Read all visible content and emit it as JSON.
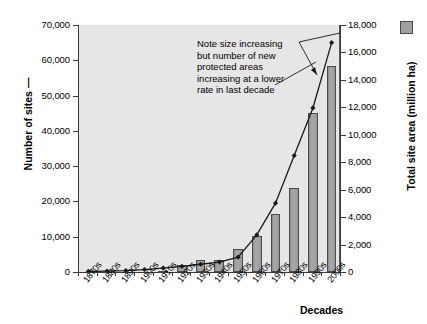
{
  "chart_data": {
    "type": "bar",
    "title": "",
    "xlabel": "Decades",
    "categories": [
      "1870s",
      "1880s",
      "1890s",
      "1900s",
      "1910s",
      "1920s",
      "1930s",
      "1940s",
      "1950s",
      "1960s",
      "1970s",
      "1980s",
      "1990s",
      "2000s"
    ],
    "grid": false,
    "legend_position": "top-right",
    "annotations": [
      {
        "text": "Note size increasing but number of new protected areas increasing at a lower rate in last decade",
        "lines": [
          "Note size increasing",
          "but number of new",
          "protected areas",
          "increasing at a lower",
          "rate in last decade"
        ]
      }
    ],
    "series": [
      {
        "name": "Total site area (million ha)",
        "type": "bar",
        "axis": "right",
        "ylabel": "Total site area (million ha)",
        "ylim": [
          0,
          18000
        ],
        "yticks": [
          "0",
          "2,000",
          "4,000",
          "6,000",
          "8,000",
          "10,000",
          "12,000",
          "14,000",
          "16,000",
          "18,000"
        ],
        "color": "#9e9e9e",
        "values": [
          0,
          0,
          0,
          0,
          100,
          500,
          900,
          900,
          1700,
          2600,
          4200,
          6100,
          11600,
          15000
        ]
      },
      {
        "name": "Number of sites",
        "type": "line",
        "axis": "left",
        "ylabel": "Number of sites",
        "ylim": [
          0,
          70000
        ],
        "yticks": [
          "0",
          "10,000",
          "20,000",
          "30,000",
          "40,000",
          "50,000",
          "60,000",
          "70,000"
        ],
        "color": "#1a1a1a",
        "marker": "diamond",
        "values": [
          150,
          250,
          400,
          700,
          1100,
          1600,
          2200,
          2800,
          4200,
          10500,
          19500,
          33000,
          46500,
          65000
        ]
      }
    ]
  },
  "axes": {
    "left": {
      "title": "Number of sites",
      "title_suffix": "—",
      "ticks": [
        "0",
        "10,000",
        "20,000",
        "30,000",
        "40,000",
        "50,000",
        "60,000",
        "70,000"
      ]
    },
    "right": {
      "title": "Total site area (million ha)",
      "ticks": [
        "0",
        "2,000",
        "4,000",
        "6,000",
        "8,000",
        "10,000",
        "12,000",
        "14,000",
        "16,000",
        "18,000"
      ]
    },
    "bottom": {
      "title": "Decades",
      "ticks": [
        "1870s",
        "1880s",
        "1890s",
        "1900s",
        "1910s",
        "1920s",
        "1930s",
        "1940s",
        "1950s",
        "1960s",
        "1970s",
        "1980s",
        "1990s",
        "2000s"
      ]
    }
  },
  "legend": {
    "bar_swatch_label": "Total site area (million ha)"
  }
}
